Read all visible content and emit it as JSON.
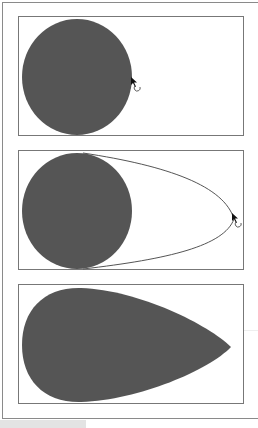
{
  "figure": {
    "colors": {
      "shape_fill": "#555555",
      "outline": "#777777",
      "frame": "#8a8a8a",
      "background": "#ffffff"
    },
    "panels": [
      {
        "step": 1,
        "label": "circle with cursor on edge",
        "shape": "circle",
        "cursor": "rotate-drag-cursor"
      },
      {
        "step": 2,
        "label": "dragging edge point outward",
        "shape": "circle-with-outline-preview",
        "cursor": "rotate-drag-cursor"
      },
      {
        "step": 3,
        "label": "resulting egg shape",
        "shape": "teardrop"
      }
    ]
  }
}
